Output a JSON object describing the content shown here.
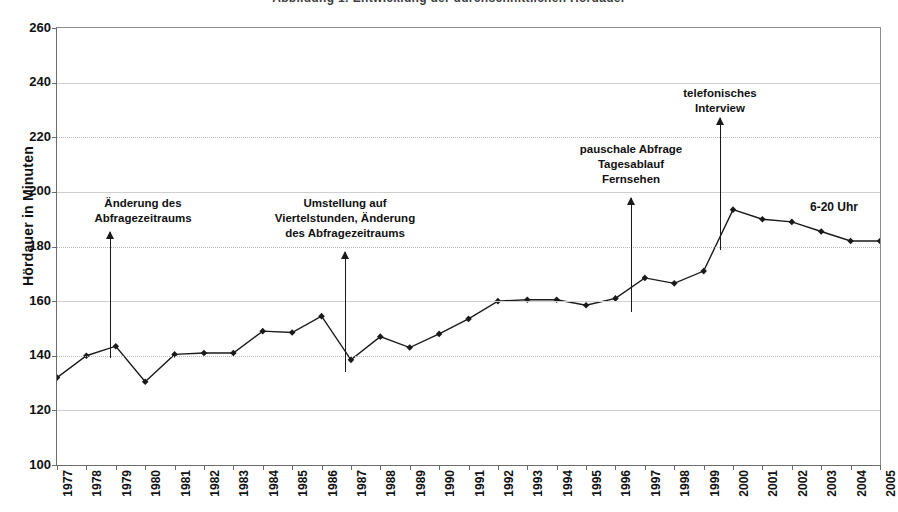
{
  "clipped_header": "Abbildung 1:  Entwicklung der durchschnittlichen Hördauer",
  "axes": {
    "y_title": "Hördauer in Minuten",
    "y_ticks": [
      260,
      240,
      220,
      200,
      180,
      160,
      140,
      120,
      100
    ],
    "y_min": 100,
    "y_max": 260,
    "x_ticks": [
      "1977",
      "1978",
      "1979",
      "1980",
      "1981",
      "1982",
      "1983",
      "1984",
      "1985",
      "1986",
      "1987",
      "1988",
      "1989",
      "1990",
      "1991",
      "1992",
      "1993",
      "1994",
      "1995",
      "1996",
      "1997",
      "1998",
      "1999",
      "2000",
      "2001",
      "2002",
      "2003",
      "2004",
      "2005"
    ]
  },
  "annotations": [
    {
      "id": "aenderung-abfragezeitraum",
      "lines": [
        "Änderung des",
        "Abfragezeitraums"
      ],
      "x_year": 1978.6,
      "text_center_x": 143,
      "text_top": 196,
      "arrow_x": 110,
      "arrow_top": 232,
      "arrow_bottom": 358
    },
    {
      "id": "umstellung-viertelstunden",
      "lines": [
        "Umstellung auf",
        "Viertelstunden, Änderung",
        "des Abfragezeitraums"
      ],
      "x_year": 1986.6,
      "text_center_x": 345,
      "text_top": 196,
      "arrow_x": 345,
      "arrow_top": 252,
      "arrow_bottom": 372
    },
    {
      "id": "pauschale-abfrage",
      "lines": [
        "pauschale Abfrage",
        "Tagesablauf",
        "Fernsehen"
      ],
      "x_year": 1996.4,
      "text_center_x": 631,
      "text_top": 142,
      "arrow_x": 631,
      "arrow_top": 198,
      "arrow_bottom": 312
    },
    {
      "id": "telefonisches-interview",
      "lines": [
        "telefonisches",
        "Interview"
      ],
      "x_year": 1999.4,
      "text_center_x": 720,
      "text_top": 86,
      "arrow_x": 720,
      "arrow_top": 118,
      "arrow_bottom": 250
    }
  ],
  "series_label": {
    "text": "6-20 Uhr",
    "x": 810,
    "y": 200
  },
  "chart_data": {
    "type": "line",
    "title": "Entwicklung der durchschnittlichen Hördauer",
    "xlabel": "",
    "ylabel": "Hördauer in Minuten",
    "ylim": [
      100,
      260
    ],
    "grid": true,
    "legend": "none",
    "series_name": "6-20 Uhr",
    "marker": "filled-diamond",
    "x": [
      1977,
      1978,
      1979,
      1980,
      1981,
      1982,
      1983,
      1984,
      1985,
      1986,
      1987,
      1988,
      1989,
      1990,
      1991,
      1992,
      1993,
      1994,
      1995,
      1996,
      1997,
      1998,
      1999,
      2000,
      2001,
      2002,
      2003,
      2004,
      2005
    ],
    "categories": [
      "1977",
      "1978",
      "1979",
      "1980",
      "1981",
      "1982",
      "1983",
      "1984",
      "1985",
      "1986",
      "1987",
      "1988",
      "1989",
      "1990",
      "1991",
      "1992",
      "1993",
      "1994",
      "1995",
      "1996",
      "1997",
      "1998",
      "1999",
      "2000",
      "2001",
      "2002",
      "2003",
      "2004",
      "2005"
    ],
    "values": [
      132,
      140,
      143.5,
      130.5,
      140.5,
      141,
      141,
      149,
      148.5,
      154.5,
      138.5,
      147,
      143,
      148,
      153.5,
      160,
      160.5,
      160.5,
      158.5,
      161,
      168.5,
      166.5,
      171,
      193.5,
      190,
      189,
      185.5,
      182,
      182
    ]
  },
  "colors": {
    "line": "#1a1a1a",
    "grid": "#b9b9b9",
    "axis": "#6b6b6b",
    "text": "#111111",
    "background": "#ffffff"
  }
}
